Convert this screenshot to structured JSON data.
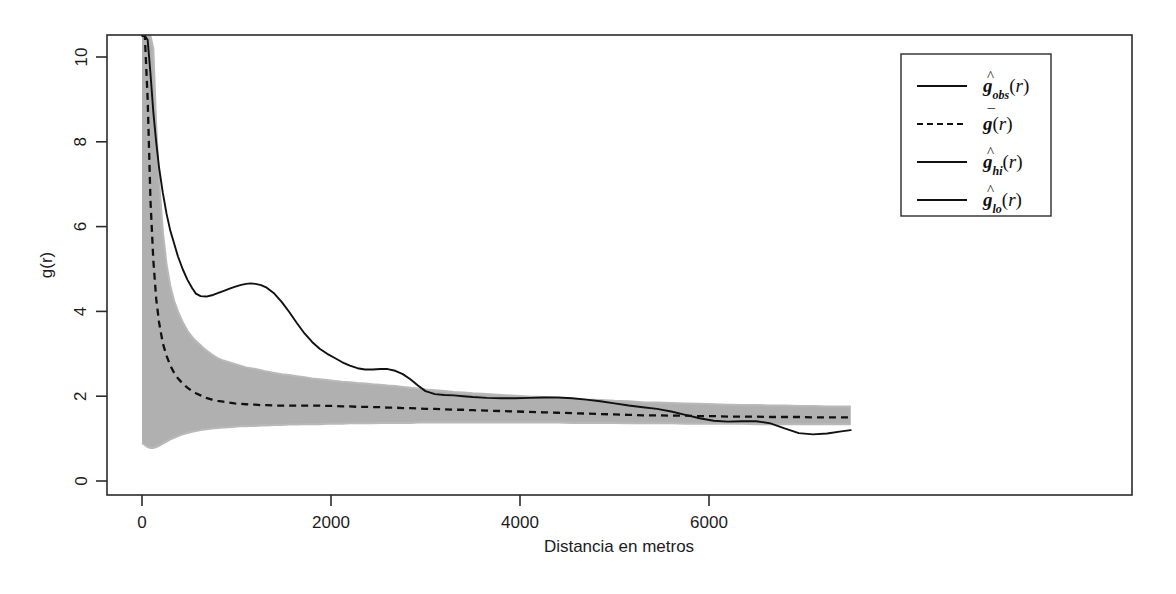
{
  "chart_data": {
    "type": "line",
    "title": "",
    "xlabel": "Distancia en metros",
    "ylabel": "g(r)",
    "xlim": [
      0,
      7500
    ],
    "ylim": [
      0,
      10.5
    ],
    "xticks": [
      0,
      2000,
      4000,
      6000
    ],
    "xticklabels": [
      "0",
      "2000",
      "4000",
      "6000"
    ],
    "yticks": [
      0,
      2,
      4,
      6,
      8,
      10
    ],
    "yticklabels": [
      "0",
      "2",
      "4",
      "6",
      "8",
      "10"
    ],
    "grid": false,
    "legend_position": "top-right",
    "colors": {
      "observed": "#111111",
      "theoretical_mean": "#111111",
      "envelope_fill": "#b0b0b0",
      "envelope_line": "#b9b9b9",
      "frame": "#2b2b2b",
      "background": "#ffffff"
    },
    "legend": [
      {
        "label": "g_obs(r)",
        "base": "g",
        "sub": "obs",
        "accent": "hat",
        "style": "solid",
        "color": "#111111"
      },
      {
        "label": "g(r)",
        "base": "g",
        "sub": "",
        "accent": "bar",
        "style": "dashed",
        "color": "#111111"
      },
      {
        "label": "g_hi(r)",
        "base": "g",
        "sub": "hi",
        "accent": "hat",
        "style": "solid",
        "color": "#b9b9b9"
      },
      {
        "label": "g_lo(r)",
        "base": "g",
        "sub": "lo",
        "accent": "hat",
        "style": "solid",
        "color": "#b9b9b9"
      }
    ],
    "x": [
      0,
      30,
      60,
      90,
      120,
      150,
      180,
      220,
      260,
      300,
      340,
      380,
      430,
      480,
      530,
      570,
      620,
      680,
      740,
      800,
      860,
      920,
      980,
      1040,
      1100,
      1150,
      1200,
      1260,
      1320,
      1400,
      1480,
      1560,
      1640,
      1720,
      1800,
      1880,
      1960,
      2040,
      2120,
      2200,
      2280,
      2360,
      2440,
      2520,
      2600,
      2680,
      2760,
      2840,
      2920,
      3000,
      3100,
      3200,
      3300,
      3400,
      3500,
      3650,
      3800,
      3950,
      4100,
      4250,
      4400,
      4550,
      4700,
      4850,
      5000,
      5150,
      5300,
      5450,
      5600,
      5750,
      5900,
      6050,
      6200,
      6350,
      6500,
      6650,
      6800,
      6950,
      7100,
      7250,
      7400,
      7500
    ],
    "series": [
      {
        "name": "g_obs(r)",
        "style": "solid",
        "values": [
          10.5,
          10.5,
          10.4,
          9.6,
          8.7,
          8.0,
          7.4,
          6.8,
          6.3,
          5.9,
          5.6,
          5.3,
          5.0,
          4.75,
          4.55,
          4.42,
          4.36,
          4.35,
          4.38,
          4.43,
          4.48,
          4.53,
          4.58,
          4.62,
          4.65,
          4.66,
          4.65,
          4.62,
          4.56,
          4.42,
          4.22,
          3.98,
          3.72,
          3.48,
          3.28,
          3.12,
          3.0,
          2.9,
          2.8,
          2.72,
          2.66,
          2.63,
          2.63,
          2.64,
          2.64,
          2.6,
          2.52,
          2.4,
          2.25,
          2.12,
          2.05,
          2.03,
          2.02,
          2.0,
          1.98,
          1.96,
          1.95,
          1.95,
          1.96,
          1.97,
          1.97,
          1.95,
          1.92,
          1.88,
          1.83,
          1.78,
          1.74,
          1.7,
          1.64,
          1.56,
          1.48,
          1.42,
          1.4,
          1.41,
          1.41,
          1.36,
          1.24,
          1.13,
          1.1,
          1.12,
          1.17,
          1.2
        ]
      },
      {
        "name": "g(r)",
        "style": "dashed",
        "values": [
          10.5,
          10.5,
          9.0,
          6.6,
          5.2,
          4.3,
          3.75,
          3.25,
          2.95,
          2.72,
          2.55,
          2.42,
          2.3,
          2.2,
          2.12,
          2.07,
          2.02,
          1.96,
          1.92,
          1.89,
          1.87,
          1.85,
          1.83,
          1.82,
          1.81,
          1.8,
          1.8,
          1.79,
          1.79,
          1.78,
          1.78,
          1.78,
          1.78,
          1.78,
          1.78,
          1.78,
          1.77,
          1.77,
          1.76,
          1.76,
          1.75,
          1.75,
          1.74,
          1.74,
          1.73,
          1.73,
          1.72,
          1.72,
          1.71,
          1.7,
          1.7,
          1.69,
          1.68,
          1.68,
          1.67,
          1.66,
          1.65,
          1.64,
          1.63,
          1.62,
          1.61,
          1.6,
          1.59,
          1.58,
          1.57,
          1.56,
          1.55,
          1.55,
          1.54,
          1.54,
          1.53,
          1.53,
          1.52,
          1.52,
          1.52,
          1.51,
          1.51,
          1.51,
          1.5,
          1.5,
          1.5,
          1.5
        ]
      },
      {
        "name": "g_hi(r)",
        "style": "solid",
        "values": [
          10.5,
          10.5,
          10.5,
          10.5,
          10.2,
          8.4,
          7.1,
          5.9,
          5.1,
          4.6,
          4.25,
          4.0,
          3.75,
          3.55,
          3.4,
          3.3,
          3.2,
          3.08,
          2.98,
          2.9,
          2.84,
          2.8,
          2.76,
          2.72,
          2.68,
          2.66,
          2.64,
          2.61,
          2.58,
          2.55,
          2.52,
          2.5,
          2.47,
          2.45,
          2.42,
          2.4,
          2.38,
          2.36,
          2.34,
          2.33,
          2.31,
          2.3,
          2.28,
          2.27,
          2.25,
          2.24,
          2.22,
          2.2,
          2.18,
          2.16,
          2.14,
          2.12,
          2.1,
          2.09,
          2.07,
          2.05,
          2.03,
          2.01,
          1.99,
          1.98,
          1.96,
          1.94,
          1.92,
          1.91,
          1.89,
          1.88,
          1.86,
          1.85,
          1.84,
          1.83,
          1.82,
          1.81,
          1.8,
          1.79,
          1.79,
          1.78,
          1.78,
          1.77,
          1.77,
          1.76,
          1.76,
          1.76
        ]
      },
      {
        "name": "g_lo(r)",
        "style": "solid",
        "values": [
          0.9,
          0.85,
          0.8,
          0.78,
          0.78,
          0.8,
          0.83,
          0.88,
          0.93,
          0.98,
          1.02,
          1.06,
          1.1,
          1.13,
          1.16,
          1.18,
          1.2,
          1.22,
          1.24,
          1.25,
          1.26,
          1.27,
          1.28,
          1.29,
          1.29,
          1.3,
          1.3,
          1.31,
          1.31,
          1.32,
          1.32,
          1.33,
          1.33,
          1.34,
          1.34,
          1.34,
          1.35,
          1.35,
          1.35,
          1.36,
          1.36,
          1.36,
          1.36,
          1.37,
          1.37,
          1.37,
          1.37,
          1.37,
          1.38,
          1.38,
          1.38,
          1.38,
          1.38,
          1.38,
          1.38,
          1.38,
          1.38,
          1.38,
          1.38,
          1.38,
          1.38,
          1.37,
          1.37,
          1.37,
          1.37,
          1.36,
          1.36,
          1.36,
          1.36,
          1.35,
          1.35,
          1.35,
          1.35,
          1.35,
          1.34,
          1.34,
          1.34,
          1.34,
          1.34,
          1.34,
          1.34,
          1.34
        ]
      }
    ]
  }
}
